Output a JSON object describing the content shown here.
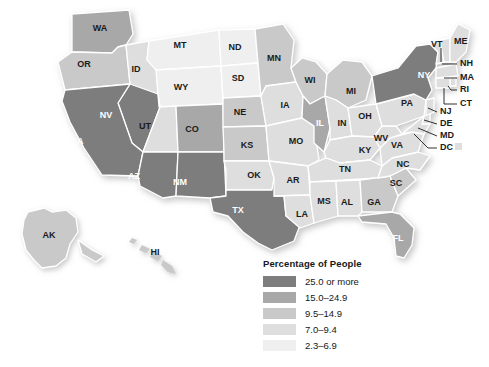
{
  "figure": {
    "type": "choropleth-map",
    "region": "United States",
    "background_color": "#ffffff"
  },
  "legend": {
    "title": "Percentage of People",
    "position": "bottom-center",
    "entries": [
      {
        "label": "25.0 or more",
        "color": "#7d7d7d",
        "class_index": 0
      },
      {
        "label": "15.0–24.9",
        "color": "#a8a8a8",
        "class_index": 1
      },
      {
        "label": "9.5–14.9",
        "color": "#c9c9c9",
        "class_index": 2
      },
      {
        "label": "7.0–9.4",
        "color": "#dedede",
        "class_index": 3
      },
      {
        "label": "2.3–6.9",
        "color": "#efefef",
        "class_index": 4
      }
    ]
  },
  "chart_data": {
    "type": "heatmap",
    "title": "Percentage of People",
    "xlabel": "",
    "ylabel": "",
    "legend_position": "bottom-center",
    "grid": false,
    "classes": [
      "25.0 or more",
      "15.0–24.9",
      "9.5–14.9",
      "7.0–9.4",
      "2.3–6.9"
    ],
    "class_colors": [
      "#7d7d7d",
      "#a8a8a8",
      "#c9c9c9",
      "#dedede",
      "#efefef"
    ],
    "categories": [
      "WA",
      "OR",
      "ID",
      "MT",
      "WY",
      "NV",
      "CA",
      "UT",
      "CO",
      "AZ",
      "NM",
      "TX",
      "ND",
      "SD",
      "NE",
      "KS",
      "OK",
      "MN",
      "IA",
      "MO",
      "AR",
      "LA",
      "WI",
      "IL",
      "MI",
      "IN",
      "OH",
      "KY",
      "TN",
      "MS",
      "AL",
      "GA",
      "FL",
      "SC",
      "NC",
      "VA",
      "WV",
      "PA",
      "NY",
      "VT",
      "NH",
      "ME",
      "MA",
      "RI",
      "CT",
      "NJ",
      "DE",
      "MD",
      "DC",
      "AK",
      "HI"
    ],
    "values": [
      1,
      2,
      3,
      4,
      4,
      0,
      0,
      3,
      1,
      0,
      0,
      0,
      4,
      4,
      2,
      2,
      3,
      2,
      3,
      3,
      3,
      3,
      2,
      1,
      2,
      3,
      3,
      3,
      3,
      3,
      3,
      2,
      1,
      2,
      3,
      3,
      3,
      3,
      0,
      3,
      3,
      3,
      3,
      3,
      3,
      3,
      3,
      3,
      3,
      2,
      3
    ],
    "value_labels": [
      "15.0–24.9",
      "9.5–14.9",
      "7.0–9.4",
      "2.3–6.9",
      "2.3–6.9",
      "25.0 or more",
      "25.0 or more",
      "7.0–9.4",
      "15.0–24.9",
      "25.0 or more",
      "25.0 or more",
      "25.0 or more",
      "2.3–6.9",
      "2.3–6.9",
      "9.5–14.9",
      "9.5–14.9",
      "7.0–9.4",
      "9.5–14.9",
      "7.0–9.4",
      "7.0–9.4",
      "7.0–9.4",
      "7.0–9.4",
      "9.5–14.9",
      "15.0–24.9",
      "9.5–14.9",
      "7.0–9.4",
      "7.0–9.4",
      "7.0–9.4",
      "7.0–9.4",
      "7.0–9.4",
      "7.0–9.4",
      "9.5–14.9",
      "15.0–24.9",
      "9.5–14.9",
      "7.0–9.4",
      "7.0–9.4",
      "7.0–9.4",
      "7.0–9.4",
      "25.0 or more",
      "7.0–9.4",
      "7.0–9.4",
      "7.0–9.4",
      "7.0–9.4",
      "7.0–9.4",
      "7.0–9.4",
      "7.0–9.4",
      "7.0–9.4",
      "7.0–9.4",
      "7.0–9.4",
      "9.5–14.9",
      "7.0–9.4"
    ]
  },
  "map": {
    "inline_labels": [
      {
        "id": "WA",
        "text": "WA",
        "x": 100,
        "y": 29,
        "on_dark": false
      },
      {
        "id": "OR",
        "text": "OR",
        "x": 84,
        "y": 65,
        "on_dark": false
      },
      {
        "id": "ID",
        "text": "ID",
        "x": 136,
        "y": 70,
        "on_dark": false
      },
      {
        "id": "MT",
        "text": "MT",
        "x": 180,
        "y": 46,
        "on_dark": false
      },
      {
        "id": "WY",
        "text": "WY",
        "x": 181,
        "y": 88,
        "on_dark": false
      },
      {
        "id": "NV",
        "text": "NV",
        "x": 106,
        "y": 116,
        "on_dark": true
      },
      {
        "id": "CA",
        "text": "CA",
        "x": 77,
        "y": 142,
        "on_dark": true
      },
      {
        "id": "UT",
        "text": "UT",
        "x": 145,
        "y": 127,
        "on_dark": false
      },
      {
        "id": "CO",
        "text": "CO",
        "x": 192,
        "y": 130,
        "on_dark": false
      },
      {
        "id": "AZ",
        "text": "AZ",
        "x": 134,
        "y": 177,
        "on_dark": true
      },
      {
        "id": "NM",
        "text": "NM",
        "x": 180,
        "y": 183,
        "on_dark": true
      },
      {
        "id": "TX",
        "text": "TX",
        "x": 238,
        "y": 211,
        "on_dark": true
      },
      {
        "id": "ND",
        "text": "ND",
        "x": 235,
        "y": 48,
        "on_dark": false
      },
      {
        "id": "SD",
        "text": "SD",
        "x": 238,
        "y": 79,
        "on_dark": false
      },
      {
        "id": "NE",
        "text": "NE",
        "x": 240,
        "y": 113,
        "on_dark": false
      },
      {
        "id": "KS",
        "text": "KS",
        "x": 247,
        "y": 146,
        "on_dark": false
      },
      {
        "id": "OK",
        "text": "OK",
        "x": 254,
        "y": 176,
        "on_dark": false
      },
      {
        "id": "MN",
        "text": "MN",
        "x": 274,
        "y": 59,
        "on_dark": false
      },
      {
        "id": "IA",
        "text": "IA",
        "x": 285,
        "y": 106,
        "on_dark": false
      },
      {
        "id": "MO",
        "text": "MO",
        "x": 296,
        "y": 142,
        "on_dark": false
      },
      {
        "id": "AR",
        "text": "AR",
        "x": 293,
        "y": 181,
        "on_dark": false
      },
      {
        "id": "LA",
        "text": "LA",
        "x": 302,
        "y": 215,
        "on_dark": false
      },
      {
        "id": "WI",
        "text": "WI",
        "x": 310,
        "y": 81,
        "on_dark": false
      },
      {
        "id": "IL",
        "text": "IL",
        "x": 320,
        "y": 124,
        "on_dark": true
      },
      {
        "id": "MI",
        "text": "MI",
        "x": 351,
        "y": 92,
        "on_dark": false
      },
      {
        "id": "IN",
        "text": "IN",
        "x": 342,
        "y": 124,
        "on_dark": false
      },
      {
        "id": "OH",
        "text": "OH",
        "x": 365,
        "y": 117,
        "on_dark": false
      },
      {
        "id": "KY",
        "text": "KY",
        "x": 365,
        "y": 151,
        "on_dark": false
      },
      {
        "id": "TN",
        "text": "TN",
        "x": 345,
        "y": 170,
        "on_dark": false
      },
      {
        "id": "MS",
        "text": "MS",
        "x": 324,
        "y": 202,
        "on_dark": false
      },
      {
        "id": "AL",
        "text": "AL",
        "x": 347,
        "y": 203,
        "on_dark": false
      },
      {
        "id": "GA",
        "text": "GA",
        "x": 374,
        "y": 203,
        "on_dark": false
      },
      {
        "id": "FL",
        "text": "FL",
        "x": 398,
        "y": 239,
        "on_dark": true
      },
      {
        "id": "SC",
        "text": "SC",
        "x": 396,
        "y": 184,
        "on_dark": false
      },
      {
        "id": "NC",
        "text": "NC",
        "x": 403,
        "y": 165,
        "on_dark": false
      },
      {
        "id": "VA",
        "text": "VA",
        "x": 397,
        "y": 146,
        "on_dark": false
      },
      {
        "id": "WV",
        "text": "WV",
        "x": 381,
        "y": 139,
        "on_dark": false
      },
      {
        "id": "PA",
        "text": "PA",
        "x": 407,
        "y": 104,
        "on_dark": false
      },
      {
        "id": "NY",
        "text": "NY",
        "x": 424,
        "y": 76,
        "on_dark": true
      },
      {
        "id": "AK",
        "text": "AK",
        "x": 49,
        "y": 236,
        "on_dark": false
      },
      {
        "id": "HI",
        "text": "HI",
        "x": 155,
        "y": 253,
        "on_dark": false
      }
    ],
    "callouts": [
      {
        "id": "VT",
        "text": "VT",
        "tx": 431,
        "ty": 45,
        "leader": "M441,48 L441,62"
      },
      {
        "id": "ME",
        "text": "ME",
        "tx": 454,
        "ty": 42,
        "leader": ""
      },
      {
        "id": "NH",
        "text": "NH",
        "tx": 460,
        "ty": 64,
        "leader": "M442,64 L457,64"
      },
      {
        "id": "MA",
        "text": "MA",
        "tx": 460,
        "ty": 78,
        "leader": "M444,78 L457,78"
      },
      {
        "id": "RI",
        "text": "RI",
        "tx": 460,
        "ty": 90,
        "leader": "M448,86 L451,90 L457,90"
      },
      {
        "id": "CT",
        "text": "CT",
        "tx": 460,
        "ty": 104,
        "leader": "M444,88 L444,104 L457,104"
      },
      {
        "id": "NJ",
        "text": "NJ",
        "tx": 440,
        "ty": 112,
        "leader": "M428,108 L437,112"
      },
      {
        "id": "DE",
        "text": "DE",
        "tx": 440,
        "ty": 124,
        "leader": "M424,120 L437,124"
      },
      {
        "id": "MD",
        "text": "MD",
        "tx": 440,
        "ty": 136,
        "leader": "M418,128 L437,136"
      },
      {
        "id": "DC",
        "text": "DC",
        "tx": 440,
        "ty": 148,
        "leader": "M414,134 L428,148 L437,148"
      }
    ]
  }
}
